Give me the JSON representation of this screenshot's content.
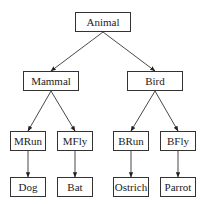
{
  "diagram": {
    "type": "tree",
    "nodes": [
      {
        "id": "animal",
        "label": "Animal",
        "x": 75,
        "y": 12,
        "w": 56,
        "h": 20
      },
      {
        "id": "mammal",
        "label": "Mammal",
        "x": 23,
        "y": 71,
        "w": 56,
        "h": 20
      },
      {
        "id": "bird",
        "label": "Bird",
        "x": 127,
        "y": 71,
        "w": 56,
        "h": 20
      },
      {
        "id": "mrun",
        "label": "MRun",
        "x": 10,
        "y": 131,
        "w": 36,
        "h": 20
      },
      {
        "id": "mfly",
        "label": "MFly",
        "x": 57,
        "y": 131,
        "w": 36,
        "h": 20
      },
      {
        "id": "brun",
        "label": "BRun",
        "x": 113,
        "y": 131,
        "w": 36,
        "h": 20
      },
      {
        "id": "bfly",
        "label": "BFly",
        "x": 160,
        "y": 131,
        "w": 36,
        "h": 20
      },
      {
        "id": "dog",
        "label": "Dog",
        "x": 10,
        "y": 177,
        "w": 36,
        "h": 20
      },
      {
        "id": "bat",
        "label": "Bat",
        "x": 57,
        "y": 177,
        "w": 36,
        "h": 20
      },
      {
        "id": "ostrich",
        "label": "Ostrich",
        "x": 113,
        "y": 177,
        "w": 36,
        "h": 20
      },
      {
        "id": "parrot",
        "label": "Parrot",
        "x": 160,
        "y": 177,
        "w": 36,
        "h": 20
      }
    ],
    "edges": [
      {
        "from": "animal",
        "to": "mammal"
      },
      {
        "from": "animal",
        "to": "bird"
      },
      {
        "from": "mammal",
        "to": "mrun"
      },
      {
        "from": "mammal",
        "to": "mfly"
      },
      {
        "from": "bird",
        "to": "brun"
      },
      {
        "from": "bird",
        "to": "bfly"
      },
      {
        "from": "mrun",
        "to": "dog"
      },
      {
        "from": "mfly",
        "to": "bat"
      },
      {
        "from": "brun",
        "to": "ostrich"
      },
      {
        "from": "bfly",
        "to": "parrot"
      }
    ],
    "colors": {
      "stroke": "#333333",
      "text": "#222222",
      "background": "#ffffff"
    }
  }
}
